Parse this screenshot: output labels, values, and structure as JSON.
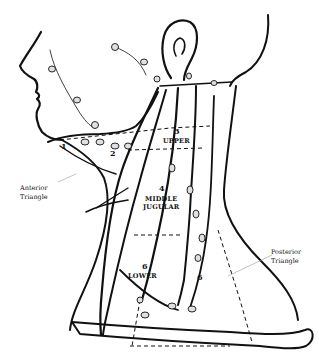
{
  "diagram": {
    "labels": {
      "anterior_triangle": [
        "Anterior",
        "Triangle"
      ],
      "posterior_triangle": [
        "Posterior",
        "Triangle"
      ],
      "level_1": "1",
      "level_2": "2",
      "level_3": "3",
      "level_3_name": "UPPER",
      "level_4": "4",
      "level_4_name": [
        "MIDDLE",
        "JUGULAR"
      ],
      "level_6_lower": "6",
      "level_6_lower_name": "LOWER",
      "level_6_posterior": "6"
    },
    "colors": {
      "line": "#111111",
      "background": "#ffffff",
      "node_fill": "#e0e0e0"
    }
  }
}
